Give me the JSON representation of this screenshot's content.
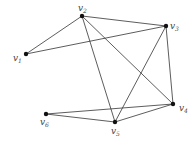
{
  "diagram": {
    "type": "graph",
    "nodes": [
      {
        "id": "v1",
        "label": "v",
        "sub": "1",
        "x": 26,
        "y": 54,
        "lx": 13,
        "ly": 61
      },
      {
        "id": "v2",
        "label": "v",
        "sub": "2",
        "x": 82,
        "y": 16,
        "lx": 78,
        "ly": 11
      },
      {
        "id": "v3",
        "label": "v",
        "sub": "3",
        "x": 166,
        "y": 26,
        "lx": 170,
        "ly": 29
      },
      {
        "id": "v4",
        "label": "v",
        "sub": "4",
        "x": 173,
        "y": 104,
        "lx": 179,
        "ly": 111
      },
      {
        "id": "v5",
        "label": "v",
        "sub": "5",
        "x": 115,
        "y": 122,
        "lx": 111,
        "ly": 134
      },
      {
        "id": "v6",
        "label": "v",
        "sub": "6",
        "x": 46,
        "y": 114,
        "lx": 40,
        "ly": 125
      }
    ],
    "edges": [
      [
        "v1",
        "v2"
      ],
      [
        "v1",
        "v3"
      ],
      [
        "v2",
        "v3"
      ],
      [
        "v2",
        "v5"
      ],
      [
        "v2",
        "v4"
      ],
      [
        "v3",
        "v5"
      ],
      [
        "v3",
        "v4"
      ],
      [
        "v6",
        "v4"
      ],
      [
        "v6",
        "v5"
      ],
      [
        "v5",
        "v4"
      ]
    ]
  }
}
